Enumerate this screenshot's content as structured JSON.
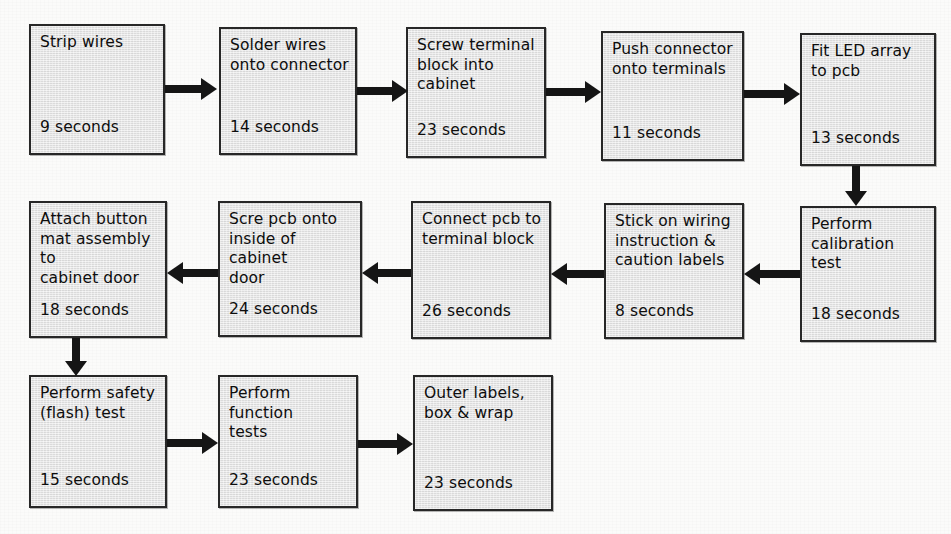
{
  "diagram": {
    "type": "process-flowchart",
    "flow_direction": "serpentine",
    "colors": {
      "node_fill": "#e3e3e3",
      "node_border": "#272727",
      "arrow": "#151515",
      "background": "#fbfbfa",
      "text": "#0d0d0d"
    },
    "nodes": [
      {
        "id": "n1",
        "label": "Strip wires",
        "duration": "9 seconds",
        "row": 1,
        "seq": 1
      },
      {
        "id": "n2",
        "label": "Solder wires\nonto connector",
        "duration": "14 seconds",
        "row": 1,
        "seq": 2
      },
      {
        "id": "n3",
        "label": "Screw terminal\nblock into\ncabinet",
        "duration": "23 seconds",
        "row": 1,
        "seq": 3
      },
      {
        "id": "n4",
        "label": "Push connector\nonto terminals",
        "duration": "11 seconds",
        "row": 1,
        "seq": 4
      },
      {
        "id": "n5",
        "label": "Fit LED array\nto pcb",
        "duration": "13 seconds",
        "row": 1,
        "seq": 5
      },
      {
        "id": "n6",
        "label": "Perform\ncalibration test",
        "duration": "18 seconds",
        "row": 2,
        "seq": 6
      },
      {
        "id": "n7",
        "label": "Stick on wiring\ninstruction &\ncaution labels",
        "duration": "8 seconds",
        "row": 2,
        "seq": 7
      },
      {
        "id": "n8",
        "label": "Connect pcb to\nterminal block",
        "duration": "26 seconds",
        "row": 2,
        "seq": 8
      },
      {
        "id": "n9",
        "label": "Scre pcb onto\ninside of cabinet\ndoor",
        "duration": "24 seconds",
        "row": 2,
        "seq": 9
      },
      {
        "id": "n10",
        "label": "Attach button\nmat assembly to\ncabinet door",
        "duration": "18 seconds",
        "row": 2,
        "seq": 10
      },
      {
        "id": "n11",
        "label": "Perform safety\n(flash) test",
        "duration": "15 seconds",
        "row": 3,
        "seq": 11
      },
      {
        "id": "n12",
        "label": "Perform function\ntests",
        "duration": "23 seconds",
        "row": 3,
        "seq": 12
      },
      {
        "id": "n13",
        "label": "Outer labels,\nbox & wrap",
        "duration": "23 seconds",
        "row": 3,
        "seq": 13
      }
    ],
    "edges": [
      {
        "from": "n1",
        "to": "n2",
        "direction": "right"
      },
      {
        "from": "n2",
        "to": "n3",
        "direction": "right"
      },
      {
        "from": "n3",
        "to": "n4",
        "direction": "right"
      },
      {
        "from": "n4",
        "to": "n5",
        "direction": "right"
      },
      {
        "from": "n5",
        "to": "n6",
        "direction": "down"
      },
      {
        "from": "n6",
        "to": "n7",
        "direction": "left"
      },
      {
        "from": "n7",
        "to": "n8",
        "direction": "left"
      },
      {
        "from": "n8",
        "to": "n9",
        "direction": "left"
      },
      {
        "from": "n9",
        "to": "n10",
        "direction": "left"
      },
      {
        "from": "n10",
        "to": "n11",
        "direction": "down"
      },
      {
        "from": "n11",
        "to": "n12",
        "direction": "right"
      },
      {
        "from": "n12",
        "to": "n13",
        "direction": "right"
      }
    ]
  }
}
